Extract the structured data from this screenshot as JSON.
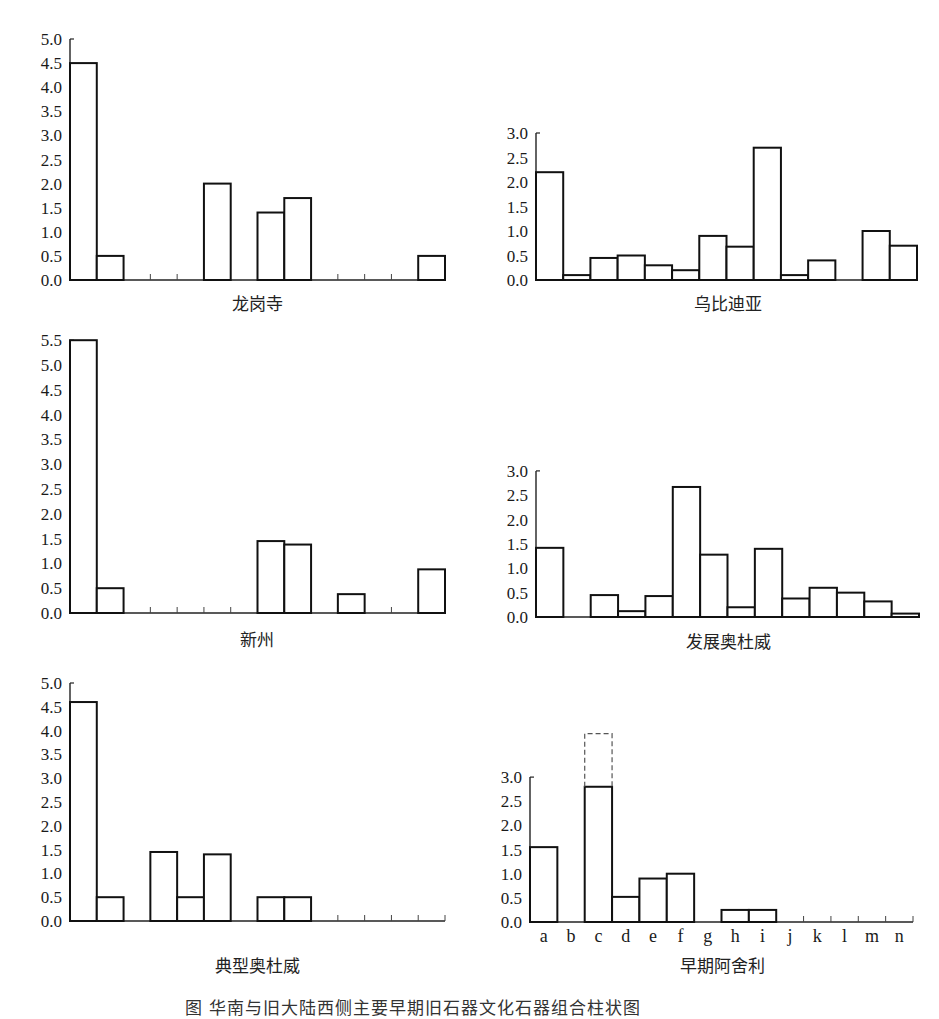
{
  "caption": "图    华南与旧大陆西侧主要早期旧石器文化石器组合柱状图",
  "categories": [
    "a",
    "b",
    "c",
    "d",
    "e",
    "f",
    "g",
    "h",
    "i",
    "j",
    "k",
    "l",
    "m",
    "n"
  ],
  "chart_data": [
    {
      "type": "bar",
      "title": "龙岗寺",
      "categories": [
        "a",
        "b",
        "c",
        "d",
        "e",
        "f",
        "g",
        "h",
        "i",
        "j",
        "k",
        "l",
        "m",
        "n"
      ],
      "values": [
        4.5,
        0.5,
        0,
        0,
        0,
        2.0,
        0,
        1.4,
        1.7,
        0,
        0,
        0,
        0,
        0.5
      ],
      "yticks": [
        "0.0",
        "0.5",
        "1.0",
        "1.5",
        "2.0",
        "2.5",
        "3.0",
        "3.5",
        "4.0",
        "4.5",
        "5.0"
      ],
      "ylim": [
        0,
        5.0
      ],
      "xlabel": "",
      "ylabel": "",
      "grid": false,
      "show_category_labels": false
    },
    {
      "type": "bar",
      "title": "乌比迪亚",
      "categories": [
        "a",
        "b",
        "c",
        "d",
        "e",
        "f",
        "g",
        "h",
        "i",
        "j",
        "k",
        "l",
        "m",
        "n"
      ],
      "values": [
        2.2,
        0.1,
        0.45,
        0.5,
        0.3,
        0.2,
        0.9,
        0.68,
        2.7,
        0.1,
        0.4,
        0,
        1.0,
        0.7
      ],
      "yticks": [
        "0.0",
        "0.5",
        "1.0",
        "1.5",
        "2.0",
        "2.5",
        "3.0"
      ],
      "ylim": [
        0,
        3.0
      ],
      "xlabel": "",
      "ylabel": "",
      "grid": false,
      "show_category_labels": false
    },
    {
      "type": "bar",
      "title": "新州",
      "categories": [
        "a",
        "b",
        "c",
        "d",
        "e",
        "f",
        "g",
        "h",
        "i",
        "j",
        "k",
        "l",
        "m",
        "n"
      ],
      "values": [
        5.5,
        0.5,
        0,
        0,
        0,
        0,
        0,
        1.45,
        1.38,
        0,
        0.38,
        0,
        0,
        0.88
      ],
      "yticks": [
        "0.0",
        "0.5",
        "1.0",
        "1.5",
        "2.0",
        "2.5",
        "3.0",
        "3.5",
        "4.0",
        "4.5",
        "5.0",
        "5.5"
      ],
      "ylim": [
        0,
        5.5
      ],
      "xlabel": "",
      "ylabel": "",
      "grid": false,
      "show_category_labels": false
    },
    {
      "type": "bar",
      "title": "发展奥杜威",
      "categories": [
        "a",
        "b",
        "c",
        "d",
        "e",
        "f",
        "g",
        "h",
        "i",
        "j",
        "k",
        "l",
        "m",
        "n"
      ],
      "values": [
        1.42,
        0,
        0.45,
        0.12,
        0.43,
        2.67,
        1.28,
        0.2,
        1.4,
        0.38,
        0.6,
        0.5,
        0.32,
        0.07
      ],
      "yticks": [
        "0.0",
        "0.5",
        "1.0",
        "1.5",
        "2.0",
        "2.5",
        "3.0"
      ],
      "ylim": [
        0,
        3.0
      ],
      "xlabel": "",
      "ylabel": "",
      "grid": false,
      "show_category_labels": false
    },
    {
      "type": "bar",
      "title": "典型奥杜威",
      "categories": [
        "a",
        "b",
        "c",
        "d",
        "e",
        "f",
        "g",
        "h",
        "i",
        "j",
        "k",
        "l",
        "m",
        "n"
      ],
      "values": [
        4.6,
        0.5,
        0,
        1.45,
        0.5,
        1.4,
        0,
        0.5,
        0.5,
        0,
        0,
        0,
        0,
        0
      ],
      "yticks": [
        "0.0",
        "0.5",
        "1.0",
        "1.5",
        "2.0",
        "2.5",
        "3.0",
        "3.5",
        "4.0",
        "4.5",
        "5.0"
      ],
      "ylim": [
        0,
        5.0
      ],
      "xlabel": "",
      "ylabel": "",
      "grid": false,
      "show_category_labels": false
    },
    {
      "type": "bar",
      "title": "早期阿舍利",
      "categories": [
        "a",
        "b",
        "c",
        "d",
        "e",
        "f",
        "g",
        "h",
        "i",
        "j",
        "k",
        "l",
        "m",
        "n"
      ],
      "values": [
        1.55,
        0,
        2.8,
        0.52,
        0.9,
        1.0,
        0,
        0.25,
        0.25,
        0,
        0,
        0,
        0,
        0
      ],
      "annotations": [
        {
          "category": "c",
          "type": "dashed-extension",
          "from": 2.8,
          "to": 3.9
        }
      ],
      "yticks": [
        "0.0",
        "0.5",
        "1.0",
        "1.5",
        "2.0",
        "2.5",
        "3.0"
      ],
      "ylim": [
        0,
        3.0
      ],
      "xlabel": "",
      "ylabel": "",
      "grid": false,
      "show_category_labels": true
    }
  ],
  "layout": [
    {
      "left": 70,
      "right": 445,
      "zero_y": 280,
      "px_per_unit": 48.2,
      "title_x": 257,
      "title_y": 296
    },
    {
      "left": 536,
      "right": 917,
      "zero_y": 280,
      "px_per_unit": 49.0,
      "title_x": 728,
      "title_y": 296
    },
    {
      "left": 70,
      "right": 445,
      "zero_y": 613,
      "px_per_unit": 49.6,
      "title_x": 257,
      "title_y": 632
    },
    {
      "left": 536,
      "right": 919,
      "zero_y": 617,
      "px_per_unit": 48.7,
      "title_x": 728,
      "title_y": 634
    },
    {
      "left": 70,
      "right": 445,
      "zero_y": 921,
      "px_per_unit": 47.6,
      "title_x": 257,
      "title_y": 958
    },
    {
      "left": 530,
      "right": 913,
      "zero_y": 922,
      "px_per_unit": 48.3,
      "title_x": 722,
      "title_y": 958
    }
  ]
}
